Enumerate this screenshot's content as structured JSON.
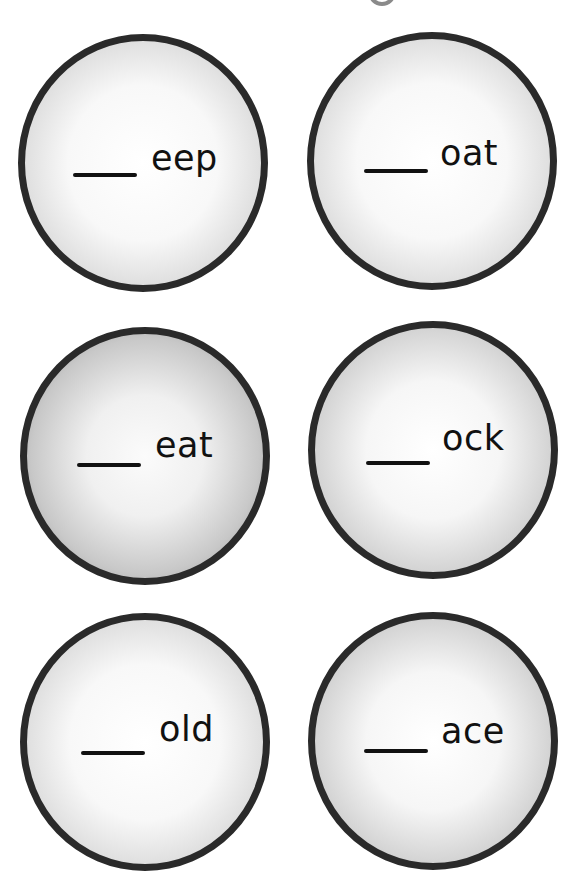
{
  "page": {
    "background": "#ffffff",
    "title_fragment_icon": "partial-letter-g-descender"
  },
  "colors": {
    "border": "#2a2a2a",
    "text": "#111111",
    "fragment": "#8a8a8a"
  },
  "cards": [
    {
      "blank": "___",
      "ending": "eep"
    },
    {
      "blank": "___",
      "ending": "oat"
    },
    {
      "blank": "___",
      "ending": "eat"
    },
    {
      "blank": "___",
      "ending": "ock"
    },
    {
      "blank": "___",
      "ending": "old"
    },
    {
      "blank": "___",
      "ending": "ace"
    }
  ]
}
